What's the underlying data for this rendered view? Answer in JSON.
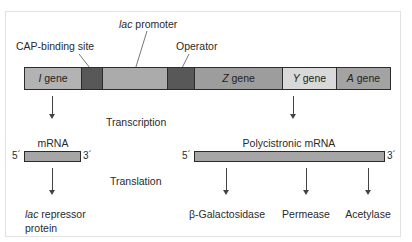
{
  "diagram": {
    "title_labels": {
      "cap_binding_site": "CAP-binding site",
      "lac_promoter_italic": "lac",
      "lac_promoter_rest": " promoter",
      "operator": "Operator"
    },
    "gene_bar": {
      "segments": [
        {
          "id": "i-gene",
          "italic": "I",
          "rest": " gene",
          "color": "#b3b3b3"
        },
        {
          "id": "cap-binding-site",
          "italic": "",
          "rest": "",
          "color": "#585858"
        },
        {
          "id": "lac-promoter",
          "italic": "",
          "rest": "",
          "color": "#ababab"
        },
        {
          "id": "operator",
          "italic": "",
          "rest": "",
          "color": "#585858"
        },
        {
          "id": "z-gene",
          "italic": "Z",
          "rest": " gene",
          "color": "#9d9d9d"
        },
        {
          "id": "y-gene",
          "italic": "Y",
          "rest": " gene",
          "color": "#d9d9d9"
        },
        {
          "id": "a-gene",
          "italic": "A",
          "rest": " gene",
          "color": "#a3a3a3"
        }
      ]
    },
    "process_labels": {
      "transcription": "Transcription",
      "translation": "Translation"
    },
    "left_branch": {
      "mrna_label": "mRNA",
      "five_prime": "5´",
      "three_prime": "3´",
      "product_italic": "lac",
      "product_rest": " repressor",
      "product_line2": "protein"
    },
    "right_branch": {
      "mrna_label": "Polycistronic mRNA",
      "five_prime": "5´",
      "three_prime": "3´",
      "products": [
        "β-Galactosidase",
        "Permease",
        "Acetylase"
      ]
    }
  }
}
